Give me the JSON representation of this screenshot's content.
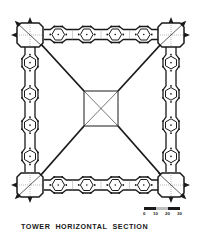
{
  "title": {
    "words": [
      "TOWER",
      "HORIZONTAL",
      "SECTION"
    ]
  },
  "scale": {
    "ticks": [
      "0",
      "10",
      "20",
      "30"
    ],
    "segments": [
      "dark",
      "light",
      "dark"
    ]
  },
  "plan": {
    "stroke": "#1a1a1a",
    "light_stroke": "#8a8a8a",
    "hexagons_per_side": 4,
    "corner_boxes": [
      "top-left",
      "top-right",
      "bottom-left",
      "bottom-right"
    ],
    "center_square": "crossed"
  }
}
